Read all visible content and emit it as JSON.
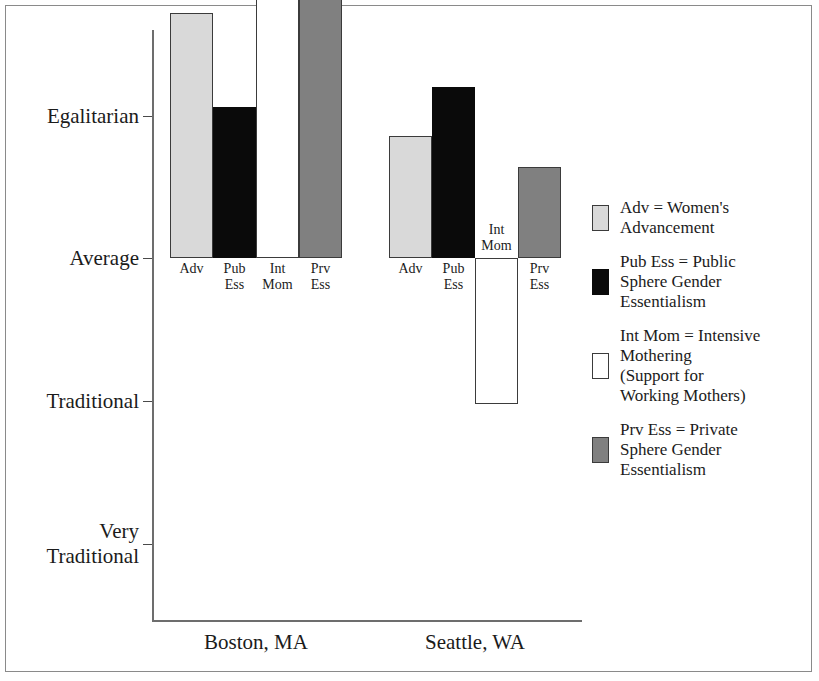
{
  "chart_data": {
    "type": "bar",
    "title": "",
    "subtitle": "",
    "xlabel": "",
    "ylabel": "",
    "grid": false,
    "legend_position": "right",
    "y_axis": {
      "tick_labels": [
        "Very\nEgalitarian",
        "Egalitarian",
        "Average",
        "Traditional",
        "Very\nTraditional"
      ],
      "tick_values": [
        2,
        1,
        0,
        -1,
        -2
      ],
      "ylim": [
        -2.55,
        1.6
      ],
      "baseline_value": 0,
      "baseline_label": "Average"
    },
    "categories": [
      "Boston, MA",
      "Seattle, WA"
    ],
    "series": [
      {
        "name": "Adv",
        "legend_key": "Adv = Women's Advancement",
        "color": "#d9d9d9",
        "values": [
          1.72,
          0.86
        ]
      },
      {
        "name": "Pub Ess",
        "legend_key": "Pub Ess = Public Sphere Gender Essentialism",
        "color": "#0a0a0a",
        "values": [
          1.06,
          1.2
        ]
      },
      {
        "name": "Int Mom",
        "legend_key": "Int Mom = Intensive Mothering (Support for Working Mothers)",
        "color": "#ffffff",
        "values": [
          2.1,
          -1.02
        ]
      },
      {
        "name": "Prv Ess",
        "legend_key": "Prv Ess = Private Sphere Gender Essentialism",
        "color": "#808080",
        "values": [
          2.04,
          0.64
        ]
      }
    ],
    "bar_labels": [
      "Adv",
      "Pub\nEss",
      "Int\nMom",
      "Prv\nEss"
    ]
  },
  "axis": {
    "ticks": [
      {
        "id": "very-egalitarian",
        "label": "Very\nEgalitarian",
        "value": 2
      },
      {
        "id": "egalitarian",
        "label": "Egalitarian",
        "value": 1
      },
      {
        "id": "average",
        "label": "Average",
        "value": 0
      },
      {
        "id": "traditional",
        "label": "Traditional",
        "value": -1
      },
      {
        "id": "very-traditional",
        "label": "Very\nTraditional",
        "value": -2
      }
    ]
  },
  "groups": [
    {
      "id": "boston",
      "label": "Boston, MA",
      "bars": [
        {
          "id": "boston-adv",
          "label": "Adv",
          "swatch": "swatch-adv",
          "value": 1.72
        },
        {
          "id": "boston-pubess",
          "label": "Pub\nEss",
          "swatch": "swatch-pubess",
          "value": 1.06
        },
        {
          "id": "boston-intmom",
          "label": "Int\nMom",
          "swatch": "swatch-intmom",
          "value": 2.1
        },
        {
          "id": "boston-prvess",
          "label": "Prv\nEss",
          "swatch": "swatch-prvess",
          "value": 2.04
        }
      ]
    },
    {
      "id": "seattle",
      "label": "Seattle, WA",
      "bars": [
        {
          "id": "seattle-adv",
          "label": "Adv",
          "swatch": "swatch-adv",
          "value": 0.86
        },
        {
          "id": "seattle-pubess",
          "label": "Pub\nEss",
          "swatch": "swatch-pubess",
          "value": 1.2
        },
        {
          "id": "seattle-intmom",
          "label": "Int\nMom",
          "swatch": "swatch-intmom",
          "value": -1.02
        },
        {
          "id": "seattle-prvess",
          "label": "Prv\nEss",
          "swatch": "swatch-prvess",
          "value": 0.64
        }
      ]
    }
  ],
  "legend": {
    "items": [
      {
        "id": "legend-adv",
        "swatch": "swatch-adv",
        "text": "Adv = Women's\nAdvancement"
      },
      {
        "id": "legend-pubess",
        "swatch": "swatch-pubess",
        "text": "Pub Ess = Public\nSphere Gender\nEssentialism"
      },
      {
        "id": "legend-intmom",
        "swatch": "swatch-intmom",
        "text": "Int Mom = Intensive\nMothering\n(Support for\nWorking Mothers)"
      },
      {
        "id": "legend-prvess",
        "swatch": "swatch-prvess",
        "text": "Prv Ess = Private\nSphere Gender\nEssentialism"
      }
    ]
  }
}
